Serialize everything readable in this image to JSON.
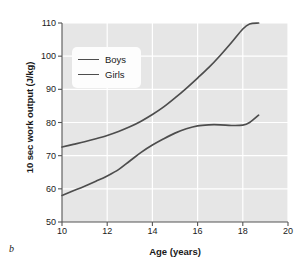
{
  "panel_letter": "b",
  "chart_data": {
    "type": "line",
    "title": "",
    "xlabel": "Age (years)",
    "ylabel": "10 sec work output (J/kg)",
    "xlim": [
      10,
      20
    ],
    "ylim": [
      50,
      110
    ],
    "xticks": [
      10,
      12,
      14,
      16,
      18,
      20
    ],
    "yticks": [
      50,
      60,
      70,
      80,
      90,
      100,
      110
    ],
    "grid": true,
    "grid_color": "#ffffff",
    "plot_background": "#e6e6e6",
    "line_color": "#4d4d4d",
    "legend_position": "upper left",
    "series": [
      {
        "name": "Boys",
        "x": [
          10,
          10.5,
          11,
          11.5,
          12,
          12.5,
          13,
          13.5,
          14,
          14.5,
          15,
          15.5,
          16,
          16.5,
          17,
          17.5,
          18,
          18.3,
          18.7
        ],
        "values": [
          72.6,
          73.4,
          74.2,
          75.1,
          76.1,
          77.3,
          78.7,
          80.4,
          82.4,
          84.7,
          87.4,
          90.3,
          93.4,
          96.6,
          100.2,
          104.1,
          108.2,
          109.7,
          110.0
        ]
      },
      {
        "name": "Girls",
        "x": [
          10,
          10.5,
          11,
          11.5,
          12,
          12.5,
          13,
          13.5,
          14,
          14.5,
          15,
          15.5,
          16,
          16.5,
          17,
          17.5,
          18,
          18.3,
          18.7
        ],
        "values": [
          58.0,
          59.4,
          60.8,
          62.3,
          63.9,
          65.8,
          68.4,
          71.0,
          73.2,
          75.1,
          76.8,
          78.1,
          79.0,
          79.3,
          79.3,
          79.1,
          79.2,
          80.0,
          82.2
        ]
      }
    ]
  },
  "legend": {
    "items": [
      {
        "label": "Boys"
      },
      {
        "label": "Girls"
      }
    ]
  }
}
